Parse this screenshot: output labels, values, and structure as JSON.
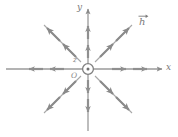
{
  "figure": {
    "kind": "vector-field-diagram",
    "width": 178,
    "height": 137
  },
  "colors": {
    "background": "#ffffff",
    "axis": "#9a9a9a",
    "field_arrow": "#8f8f8f",
    "diagonal_arrow": "#8a8a8a",
    "label": "#7a7a7a",
    "origin_marker": "#7f7f7f"
  },
  "axes": {
    "x": {
      "label": "x",
      "orientation": "horizontal",
      "arrow_at": "right",
      "y_pixel": 69,
      "x_start": 6,
      "x_end": 163
    },
    "y": {
      "label": "y",
      "orientation": "vertical",
      "arrow_at": "top",
      "x_pixel": 88,
      "y_start": 131,
      "y_end": 8
    },
    "z": {
      "label": "z",
      "orientation": "out-of-page",
      "marker": "circle-dot-icon",
      "note": "circle with central dot denotes vector pointing out of the page"
    }
  },
  "origin": {
    "label": "O",
    "x_pixel": 88,
    "y_pixel": 69,
    "marker_radius": 5.5,
    "dot_radius": 1.4
  },
  "vector_field": {
    "label": "h",
    "label_has_overarrow": true,
    "label_display": "h⃗",
    "pattern": "radial-outward",
    "ray_count": 8,
    "arrows_per_ray": 2,
    "rays": [
      {
        "name": "ray-east",
        "angle_deg": 0,
        "arrow_radii": [
          36,
          58
        ]
      },
      {
        "name": "ray-northeast",
        "angle_deg": 45,
        "arrow_radii": [
          34,
          56
        ]
      },
      {
        "name": "ray-north",
        "angle_deg": 90,
        "arrow_radii": [
          30,
          52
        ]
      },
      {
        "name": "ray-northwest",
        "angle_deg": 135,
        "arrow_radii": [
          34,
          56
        ]
      },
      {
        "name": "ray-west",
        "angle_deg": 180,
        "arrow_radii": [
          36,
          58
        ]
      },
      {
        "name": "ray-southwest",
        "angle_deg": 225,
        "arrow_radii": [
          34,
          56
        ]
      },
      {
        "name": "ray-south",
        "angle_deg": 270,
        "arrow_radii": [
          30,
          52
        ]
      },
      {
        "name": "ray-southeast",
        "angle_deg": 315,
        "arrow_radii": [
          34,
          56
        ]
      }
    ]
  },
  "labels": {
    "y_axis": "y",
    "x_axis": "x",
    "z_axis": "z",
    "origin": "O",
    "vector": "h"
  }
}
